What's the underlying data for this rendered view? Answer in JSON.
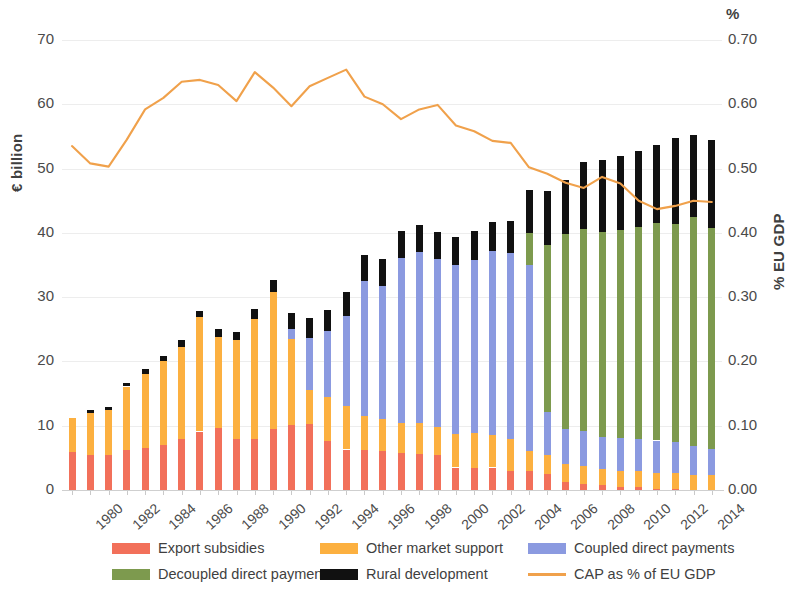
{
  "axes": {
    "y_left_title": "€ billion",
    "y_right_title": "% EU GDP",
    "pct_symbol": "%",
    "y_left_ticks": [
      "70",
      "60",
      "50",
      "40",
      "30",
      "20",
      "10",
      "0"
    ],
    "y_right_ticks": [
      "0.70",
      "0.60",
      "0.50",
      "0.40",
      "0.30",
      "0.20",
      "0.10",
      "0.00"
    ],
    "x_ticks": [
      "1980",
      "1982",
      "1984",
      "1986",
      "1988",
      "1990",
      "1992",
      "1994",
      "1996",
      "1998",
      "2000",
      "2002",
      "2004",
      "2006",
      "2008",
      "2010",
      "2012",
      "2014"
    ]
  },
  "legend": {
    "items": [
      {
        "label": "Export subsidies",
        "color": "#f2705a",
        "type": "box"
      },
      {
        "label": "Other market support",
        "color": "#fcb040",
        "type": "box"
      },
      {
        "label": "Coupled direct payments",
        "color": "#8b9ae0",
        "type": "box"
      },
      {
        "label": "Decoupled direct payments",
        "color": "#7d9a4e",
        "type": "box"
      },
      {
        "label": "Rural development",
        "color": "#111111",
        "type": "box"
      },
      {
        "label": "CAP as % of EU GDP",
        "color": "#f0a14b",
        "type": "line"
      }
    ]
  },
  "chart_data": {
    "type": "bar",
    "title": "",
    "subtitle": "",
    "xlabel": "",
    "ylabel": "€ billion",
    "y2label": "% EU GDP",
    "ylim": [
      0,
      70
    ],
    "y2lim": [
      0.0,
      0.7
    ],
    "grid": true,
    "legend_position": "bottom",
    "stacked": true,
    "categories": [
      "1980",
      "1981",
      "1982",
      "1983",
      "1984",
      "1985",
      "1986",
      "1987",
      "1988",
      "1989",
      "1990",
      "1991",
      "1992",
      "1993",
      "1994",
      "1995",
      "1996",
      "1997",
      "1998",
      "1999",
      "2000",
      "2001",
      "2002",
      "2003",
      "2004",
      "2005",
      "2006",
      "2007",
      "2008",
      "2009",
      "2010",
      "2011",
      "2012",
      "2013",
      "2014",
      "2015"
    ],
    "series": [
      {
        "name": "Export subsidies",
        "color": "#f2705a",
        "values": [
          5.9,
          5.4,
          5.5,
          6.3,
          6.6,
          7.0,
          8.0,
          9.1,
          9.6,
          8.0,
          8.0,
          9.5,
          10.1,
          10.2,
          7.6,
          6.3,
          6.2,
          6.0,
          5.8,
          5.6,
          5.5,
          3.5,
          3.4,
          3.5,
          3.0,
          2.9,
          2.5,
          1.3,
          1.0,
          0.8,
          0.5,
          0.4,
          0.2,
          0.1,
          0.0,
          0.0
        ],
        "unit": "€ billion"
      },
      {
        "name": "Other market support",
        "color": "#fcb040",
        "values": [
          5.3,
          6.6,
          6.9,
          9.8,
          11.5,
          13.0,
          14.3,
          17.8,
          14.2,
          15.4,
          18.6,
          21.3,
          13.4,
          5.3,
          6.8,
          6.8,
          5.3,
          5.0,
          4.6,
          4.8,
          4.3,
          5.2,
          5.4,
          5.1,
          4.9,
          3.2,
          3.0,
          2.8,
          2.8,
          2.5,
          2.5,
          2.5,
          2.5,
          2.5,
          2.4,
          2.4
        ],
        "unit": "€ billion"
      },
      {
        "name": "Coupled direct payments",
        "color": "#8b9ae0",
        "values": [
          0,
          0,
          0,
          0,
          0,
          0,
          0,
          0,
          0,
          0,
          0,
          0,
          1.6,
          8.2,
          10.3,
          13.9,
          21.0,
          20.7,
          25.7,
          26.6,
          26.1,
          26.3,
          27.0,
          28.6,
          29.0,
          28.9,
          6.6,
          5.4,
          5.4,
          5.0,
          5.1,
          5.0,
          5.0,
          4.9,
          4.5,
          4.0
        ],
        "unit": "€ billion"
      },
      {
        "name": "Decoupled direct payments",
        "color": "#7d9a4e",
        "values": [
          0,
          0,
          0,
          0,
          0,
          0,
          0,
          0,
          0,
          0,
          0,
          0,
          0,
          0,
          0,
          0,
          0,
          0,
          0,
          0,
          0,
          0,
          0,
          0,
          0,
          5.0,
          26.0,
          30.3,
          31.4,
          31.9,
          32.3,
          33.0,
          33.8,
          33.9,
          35.5,
          34.4
        ],
        "unit": "€ billion"
      },
      {
        "name": "Rural development",
        "color": "#111111",
        "values": [
          0,
          0.4,
          0.5,
          0.5,
          0.7,
          0.8,
          1.0,
          1.0,
          1.3,
          1.2,
          1.6,
          1.8,
          2.4,
          3.0,
          3.3,
          3.8,
          4.1,
          4.3,
          4.2,
          4.3,
          4.2,
          4.4,
          4.5,
          4.5,
          5.0,
          6.6,
          8.4,
          8.5,
          10.5,
          11.1,
          11.5,
          11.9,
          12.2,
          13.3,
          12.9,
          13.6
        ],
        "unit": "€ billion"
      }
    ],
    "line_series": {
      "name": "CAP as % of EU GDP",
      "color": "#f0a14b",
      "axis": "right",
      "unit": "% of EU GDP",
      "values": [
        0.535,
        0.508,
        0.503,
        0.545,
        0.592,
        0.61,
        0.635,
        0.638,
        0.63,
        0.605,
        0.65,
        0.626,
        0.597,
        0.628,
        0.641,
        0.654,
        0.612,
        0.6,
        0.577,
        0.592,
        0.599,
        0.567,
        0.558,
        0.543,
        0.54,
        0.502,
        0.492,
        0.478,
        0.47,
        0.487,
        0.477,
        0.45,
        0.437,
        0.442,
        0.45,
        0.448,
        0.443,
        0.438,
        0.44,
        0.442,
        0.44,
        0.406
      ]
    }
  }
}
